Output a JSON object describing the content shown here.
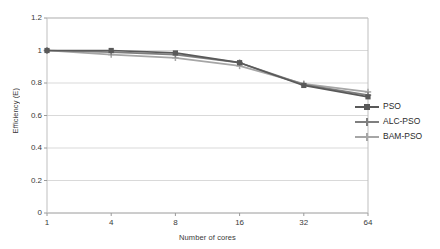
{
  "chart_data": {
    "type": "line",
    "title": "",
    "xlabel": "Number of cores",
    "ylabel": "Efficiency (E)",
    "categories": [
      "1",
      "4",
      "8",
      "16",
      "32",
      "64"
    ],
    "x_tick_labels": [
      "1",
      "4",
      "8",
      "16",
      "32",
      "64"
    ],
    "y_tick_labels": [
      "0",
      "0.2",
      "0.4",
      "0.6",
      "0.8",
      "1",
      "1.2"
    ],
    "y_tick_values": [
      0,
      0.2,
      0.4,
      0.6,
      0.8,
      1,
      1.2
    ],
    "ylim": [
      0,
      1.2
    ],
    "grid": "horizontal",
    "legend_position": "right",
    "series": [
      {
        "name": "PSO",
        "color": "#595959",
        "marker": "square",
        "values": [
          1.0,
          1.0,
          0.985,
          0.925,
          0.785,
          0.715
        ]
      },
      {
        "name": "ALC-PSO",
        "color": "#7f7f7f",
        "marker": "plus",
        "values": [
          1.0,
          0.99,
          0.975,
          0.925,
          0.79,
          0.725
        ]
      },
      {
        "name": "BAM-PSO",
        "color": "#a6a6a6",
        "marker": "plus",
        "values": [
          1.0,
          0.975,
          0.955,
          0.905,
          0.795,
          0.745
        ]
      }
    ]
  },
  "axes": {
    "y_title": "Efficiency (E)",
    "x_title": "Number of cores"
  },
  "legend": {
    "items": [
      {
        "label": "PSO"
      },
      {
        "label": "ALC-PSO"
      },
      {
        "label": "BAM-PSO"
      }
    ]
  },
  "colors": {
    "plot_border": "#bfbfbf",
    "gridline": "#d9d9d9",
    "text": "#3a3a3a",
    "background": "#ffffff"
  }
}
